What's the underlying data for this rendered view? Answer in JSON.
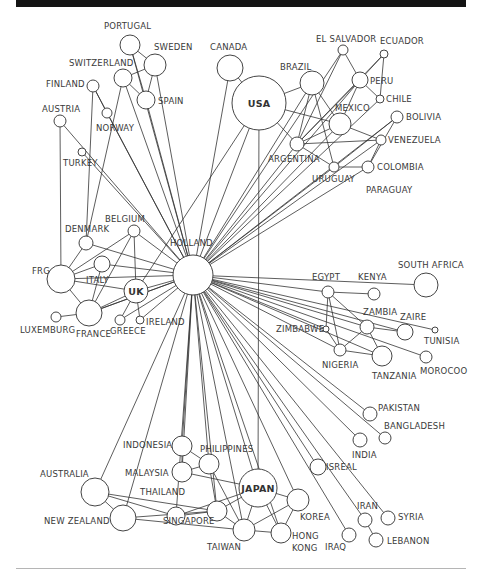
{
  "diagram": {
    "title": "",
    "hub": "HOLLAND",
    "nodes": [
      {
        "id": "HOLLAND",
        "label": "HOLLAND",
        "x": 193,
        "y": 275,
        "r": 20,
        "lx": 170,
        "ly": 246,
        "anchor": "start"
      },
      {
        "id": "USA",
        "label": "USA",
        "x": 259,
        "y": 103,
        "r": 27,
        "inside": true
      },
      {
        "id": "CANADA",
        "label": "CANADA",
        "x": 230,
        "y": 68,
        "r": 13,
        "lx": 210,
        "ly": 50,
        "anchor": "start"
      },
      {
        "id": "BRAZIL",
        "label": "BRAZIL",
        "x": 312,
        "y": 83,
        "r": 12,
        "lx": 280,
        "ly": 70,
        "anchor": "start"
      },
      {
        "id": "EL SALVADOR",
        "label": "EL SALVADOR",
        "x": 343,
        "y": 50,
        "r": 5,
        "lx": 316,
        "ly": 42,
        "anchor": "start"
      },
      {
        "id": "ECUADOR",
        "label": "ECUADOR",
        "x": 384,
        "y": 54,
        "r": 4,
        "lx": 380,
        "ly": 44,
        "anchor": "start"
      },
      {
        "id": "PERU",
        "label": "PERU",
        "x": 360,
        "y": 80,
        "r": 8,
        "lx": 370,
        "ly": 84,
        "anchor": "start"
      },
      {
        "id": "CHILE",
        "label": "CHILE",
        "x": 380,
        "y": 99,
        "r": 4,
        "lx": 386,
        "ly": 102,
        "anchor": "start"
      },
      {
        "id": "MEXICO",
        "label": "MEXICO",
        "x": 340,
        "y": 124,
        "r": 11,
        "lx": 335,
        "ly": 111,
        "anchor": "start"
      },
      {
        "id": "BOLIVIA",
        "label": "BOLIVIA",
        "x": 397,
        "y": 117,
        "r": 6,
        "lx": 406,
        "ly": 120,
        "anchor": "start"
      },
      {
        "id": "VENEZUELA",
        "label": "VENEZUELA",
        "x": 381,
        "y": 140,
        "r": 5,
        "lx": 388,
        "ly": 143,
        "anchor": "start"
      },
      {
        "id": "ARGENTINA",
        "label": "ARGENTINA",
        "x": 297,
        "y": 144,
        "r": 7,
        "lx": 268,
        "ly": 162,
        "anchor": "start"
      },
      {
        "id": "URUGUAY",
        "label": "URUGUAY",
        "x": 334,
        "y": 167,
        "r": 5,
        "lx": 312,
        "ly": 182,
        "anchor": "start"
      },
      {
        "id": "COLOMBIA",
        "label": "COLOMBIA",
        "x": 368,
        "y": 167,
        "r": 6,
        "lx": 377,
        "ly": 170,
        "anchor": "start"
      },
      {
        "id": "PARAGUAY",
        "label": "PARAGUAY",
        "x": 0,
        "y": 0,
        "r": 0,
        "lx": 366,
        "ly": 193,
        "anchor": "start",
        "labelOnly": true
      },
      {
        "id": "PORTUGAL",
        "label": "PORTUGAL",
        "x": 130,
        "y": 45,
        "r": 10,
        "lx": 104,
        "ly": 29,
        "anchor": "start"
      },
      {
        "id": "SWEDEN",
        "label": "SWEDEN",
        "x": 155,
        "y": 65,
        "r": 11,
        "lx": 154,
        "ly": 50,
        "anchor": "start"
      },
      {
        "id": "SWITZERLAND",
        "label": "SWITZERLAND",
        "x": 123,
        "y": 78,
        "r": 9,
        "lx": 69,
        "ly": 66,
        "anchor": "start"
      },
      {
        "id": "SPAIN",
        "label": "SPAIN",
        "x": 146,
        "y": 100,
        "r": 9,
        "lx": 158,
        "ly": 104,
        "anchor": "start"
      },
      {
        "id": "FINLAND",
        "label": "FINLAND",
        "x": 93,
        "y": 86,
        "r": 6,
        "lx": 46,
        "ly": 87,
        "anchor": "start"
      },
      {
        "id": "NORWAY",
        "label": "NORWAY",
        "x": 107,
        "y": 113,
        "r": 5,
        "lx": 96,
        "ly": 131,
        "anchor": "start"
      },
      {
        "id": "AUSTRIA",
        "label": "AUSTRIA",
        "x": 60,
        "y": 121,
        "r": 6,
        "lx": 42,
        "ly": 112,
        "anchor": "start"
      },
      {
        "id": "TURKEY",
        "label": "TURKEY",
        "x": 82,
        "y": 152,
        "r": 4,
        "lx": 63,
        "ly": 166,
        "anchor": "start"
      },
      {
        "id": "BELGIUM",
        "label": "BELGIUM",
        "x": 134,
        "y": 231,
        "r": 6,
        "lx": 105,
        "ly": 222,
        "anchor": "start"
      },
      {
        "id": "DENMARK",
        "label": "DENMARK",
        "x": 86,
        "y": 243,
        "r": 7,
        "lx": 65,
        "ly": 232,
        "anchor": "start"
      },
      {
        "id": "ITALY",
        "label": "ITALY",
        "x": 102,
        "y": 264,
        "r": 8,
        "lx": 86,
        "ly": 283,
        "anchor": "start"
      },
      {
        "id": "FRG",
        "label": "FRG",
        "x": 61,
        "y": 279,
        "r": 14,
        "lx": 32,
        "ly": 274,
        "anchor": "start"
      },
      {
        "id": "UK",
        "label": "UK",
        "x": 136,
        "y": 291,
        "r": 12,
        "inside": true
      },
      {
        "id": "LUXEMBURG",
        "label": "LUXEMBURG",
        "x": 56,
        "y": 317,
        "r": 5,
        "lx": 20,
        "ly": 333,
        "anchor": "start"
      },
      {
        "id": "FRANCE",
        "label": "FRANCE",
        "x": 89,
        "y": 313,
        "r": 13,
        "lx": 76,
        "ly": 337,
        "anchor": "start"
      },
      {
        "id": "GREECE",
        "label": "GREECE",
        "x": 120,
        "y": 320,
        "r": 5,
        "lx": 110,
        "ly": 334,
        "anchor": "start"
      },
      {
        "id": "IRELAND",
        "label": "IRELAND",
        "x": 140,
        "y": 320,
        "r": 4,
        "lx": 146,
        "ly": 325,
        "anchor": "start"
      },
      {
        "id": "EGYPT",
        "label": "EGYPT",
        "x": 328,
        "y": 292,
        "r": 6,
        "lx": 312,
        "ly": 280,
        "anchor": "start"
      },
      {
        "id": "KENYA",
        "label": "KENYA",
        "x": 374,
        "y": 294,
        "r": 6,
        "lx": 358,
        "ly": 280,
        "anchor": "start"
      },
      {
        "id": "SOUTH AFRICA",
        "label": "SOUTH AFRICA",
        "x": 426,
        "y": 285,
        "r": 12,
        "lx": 398,
        "ly": 268,
        "anchor": "start"
      },
      {
        "id": "ZAMBIA",
        "label": "ZAMBIA",
        "x": 367,
        "y": 327,
        "r": 7,
        "lx": 363,
        "ly": 315,
        "anchor": "start"
      },
      {
        "id": "ZAIRE",
        "label": "ZAIRE",
        "x": 405,
        "y": 332,
        "r": 8,
        "lx": 400,
        "ly": 320,
        "anchor": "start"
      },
      {
        "id": "TUNISIA",
        "label": "TUNISIA",
        "x": 435,
        "y": 330,
        "r": 3,
        "lx": 424,
        "ly": 344,
        "anchor": "start"
      },
      {
        "id": "ZIMBABWE",
        "label": "ZIMBABWE",
        "x": 326,
        "y": 329,
        "r": 3,
        "lx": 276,
        "ly": 332,
        "anchor": "start"
      },
      {
        "id": "NIGERIA",
        "label": "NIGERIA",
        "x": 340,
        "y": 350,
        "r": 6,
        "lx": 322,
        "ly": 368,
        "anchor": "start"
      },
      {
        "id": "TANZANIA",
        "label": "TANZANIA",
        "x": 382,
        "y": 356,
        "r": 10,
        "lx": 372,
        "ly": 379,
        "anchor": "start"
      },
      {
        "id": "MOROCOO",
        "label": "MOROCOO",
        "x": 426,
        "y": 357,
        "r": 6,
        "lx": 420,
        "ly": 374,
        "anchor": "start"
      },
      {
        "id": "PAKISTAN",
        "label": "PAKISTAN",
        "x": 370,
        "y": 414,
        "r": 7,
        "lx": 378,
        "ly": 411,
        "anchor": "start"
      },
      {
        "id": "BANGLADESH",
        "label": "BANGLADESH",
        "x": 385,
        "y": 438,
        "r": 6,
        "lx": 384,
        "ly": 429,
        "anchor": "start"
      },
      {
        "id": "INDIA",
        "label": "INDIA",
        "x": 360,
        "y": 440,
        "r": 7,
        "lx": 352,
        "ly": 458,
        "anchor": "start"
      },
      {
        "id": "ISREAL",
        "label": "ISREAL",
        "x": 318,
        "y": 467,
        "r": 8,
        "lx": 326,
        "ly": 470,
        "anchor": "start"
      },
      {
        "id": "IRAN",
        "label": "IRAN",
        "x": 365,
        "y": 520,
        "r": 7,
        "lx": 357,
        "ly": 509,
        "anchor": "start"
      },
      {
        "id": "SYRIA",
        "label": "SYRIA",
        "x": 388,
        "y": 518,
        "r": 7,
        "lx": 398,
        "ly": 520,
        "anchor": "start"
      },
      {
        "id": "LEBANON",
        "label": "LEBANON",
        "x": 376,
        "y": 540,
        "r": 7,
        "lx": 387,
        "ly": 544,
        "anchor": "start"
      },
      {
        "id": "IRAQ",
        "label": "IRAQ",
        "x": 349,
        "y": 535,
        "r": 7,
        "lx": 325,
        "ly": 550,
        "anchor": "start"
      },
      {
        "id": "JAPAN",
        "label": "JAPAN",
        "x": 258,
        "y": 488,
        "r": 19,
        "inside": true
      },
      {
        "id": "KOREA",
        "label": "KOREA",
        "x": 298,
        "y": 500,
        "r": 11,
        "lx": 300,
        "ly": 520,
        "anchor": "start"
      },
      {
        "id": "HONG KONG",
        "label": "HONG",
        "label2": "KONG",
        "x": 281,
        "y": 533,
        "r": 10,
        "lx": 292,
        "ly": 539,
        "anchor": "start"
      },
      {
        "id": "TAIWAN",
        "label": "TAIWAN",
        "x": 244,
        "y": 530,
        "r": 11,
        "lx": 207,
        "ly": 550,
        "anchor": "start"
      },
      {
        "id": "SINGAPORE",
        "label": "SINGAPORE",
        "x": 217,
        "y": 511,
        "r": 10,
        "lx": 163,
        "ly": 524,
        "anchor": "start"
      },
      {
        "id": "THAILAND",
        "label": "THAILAND",
        "x": 176,
        "y": 516,
        "r": 9,
        "lx": 140,
        "ly": 495,
        "anchor": "start"
      },
      {
        "id": "PHILIPPINES",
        "label": "PHILIPPINES",
        "x": 209,
        "y": 464,
        "r": 10,
        "lx": 200,
        "ly": 452,
        "anchor": "start"
      },
      {
        "id": "INDONESIA",
        "label": "INDONESIA",
        "x": 182,
        "y": 446,
        "r": 10,
        "lx": 123,
        "ly": 448,
        "anchor": "start"
      },
      {
        "id": "MALAYSIA",
        "label": "MALAYSIA",
        "x": 182,
        "y": 472,
        "r": 10,
        "lx": 125,
        "ly": 476,
        "anchor": "start"
      },
      {
        "id": "AUSTRALIA",
        "label": "AUSTRALIA",
        "x": 95,
        "y": 492,
        "r": 14,
        "lx": 40,
        "ly": 477,
        "anchor": "start"
      },
      {
        "id": "NEW ZEALAND",
        "label": "NEW ZEALAND",
        "x": 123,
        "y": 518,
        "r": 13,
        "lx": 44,
        "ly": 524,
        "anchor": "start"
      }
    ],
    "edges": [
      [
        "HOLLAND",
        "USA"
      ],
      [
        "HOLLAND",
        "CANADA"
      ],
      [
        "HOLLAND",
        "BRAZIL"
      ],
      [
        "HOLLAND",
        "MEXICO"
      ],
      [
        "HOLLAND",
        "ARGENTINA"
      ],
      [
        "HOLLAND",
        "PERU"
      ],
      [
        "HOLLAND",
        "CHILE"
      ],
      [
        "HOLLAND",
        "VENEZUELA"
      ],
      [
        "HOLLAND",
        "BOLIVIA"
      ],
      [
        "HOLLAND",
        "URUGUAY"
      ],
      [
        "HOLLAND",
        "COLOMBIA"
      ],
      [
        "HOLLAND",
        "EL SALVADOR"
      ],
      [
        "HOLLAND",
        "PORTUGAL"
      ],
      [
        "HOLLAND",
        "SWEDEN"
      ],
      [
        "HOLLAND",
        "SPAIN"
      ],
      [
        "HOLLAND",
        "SWITZERLAND"
      ],
      [
        "HOLLAND",
        "NORWAY"
      ],
      [
        "HOLLAND",
        "AUSTRIA"
      ],
      [
        "HOLLAND",
        "FINLAND"
      ],
      [
        "HOLLAND",
        "TURKEY"
      ],
      [
        "HOLLAND",
        "BELGIUM"
      ],
      [
        "HOLLAND",
        "DENMARK"
      ],
      [
        "HOLLAND",
        "FRG"
      ],
      [
        "HOLLAND",
        "UK"
      ],
      [
        "HOLLAND",
        "ITALY"
      ],
      [
        "HOLLAND",
        "FRANCE"
      ],
      [
        "HOLLAND",
        "GREECE"
      ],
      [
        "HOLLAND",
        "IRELAND"
      ],
      [
        "HOLLAND",
        "EGYPT"
      ],
      [
        "HOLLAND",
        "SOUTH AFRICA"
      ],
      [
        "HOLLAND",
        "ZAMBIA"
      ],
      [
        "HOLLAND",
        "ZAIRE"
      ],
      [
        "HOLLAND",
        "TUNISIA"
      ],
      [
        "HOLLAND",
        "ZIMBABWE"
      ],
      [
        "HOLLAND",
        "NIGERIA"
      ],
      [
        "HOLLAND",
        "TANZANIA"
      ],
      [
        "HOLLAND",
        "MOROCOO"
      ],
      [
        "HOLLAND",
        "PAKISTAN"
      ],
      [
        "HOLLAND",
        "BANGLADESH"
      ],
      [
        "HOLLAND",
        "INDIA"
      ],
      [
        "HOLLAND",
        "ISREAL"
      ],
      [
        "HOLLAND",
        "IRAN"
      ],
      [
        "HOLLAND",
        "IRAQ"
      ],
      [
        "HOLLAND",
        "SYRIA"
      ],
      [
        "HOLLAND",
        "JAPAN"
      ],
      [
        "HOLLAND",
        "KOREA"
      ],
      [
        "HOLLAND",
        "HONG KONG"
      ],
      [
        "HOLLAND",
        "TAIWAN"
      ],
      [
        "HOLLAND",
        "SINGAPORE"
      ],
      [
        "HOLLAND",
        "PHILIPPINES"
      ],
      [
        "HOLLAND",
        "INDONESIA"
      ],
      [
        "HOLLAND",
        "MALAYSIA"
      ],
      [
        "HOLLAND",
        "THAILAND"
      ],
      [
        "HOLLAND",
        "AUSTRALIA"
      ],
      [
        "HOLLAND",
        "NEW ZEALAND"
      ],
      [
        "USA",
        "CANADA"
      ],
      [
        "USA",
        "BRAZIL"
      ],
      [
        "USA",
        "MEXICO"
      ],
      [
        "USA",
        "ARGENTINA"
      ],
      [
        "USA",
        "JAPAN"
      ],
      [
        "USA",
        "UK"
      ],
      [
        "BRAZIL",
        "ARGENTINA"
      ],
      [
        "BRAZIL",
        "MEXICO"
      ],
      [
        "BRAZIL",
        "URUGUAY"
      ],
      [
        "EL SALVADOR",
        "PERU"
      ],
      [
        "EL SALVADOR",
        "ARGENTINA"
      ],
      [
        "ECUADOR",
        "PERU"
      ],
      [
        "ECUADOR",
        "CHILE"
      ],
      [
        "ECUADOR",
        "ARGENTINA"
      ],
      [
        "PERU",
        "CHILE"
      ],
      [
        "PERU",
        "MEXICO"
      ],
      [
        "PERU",
        "ARGENTINA"
      ],
      [
        "MEXICO",
        "ARGENTINA"
      ],
      [
        "MEXICO",
        "VENEZUELA"
      ],
      [
        "ARGENTINA",
        "VENEZUELA"
      ],
      [
        "ARGENTINA",
        "URUGUAY"
      ],
      [
        "URUGUAY",
        "COLOMBIA"
      ],
      [
        "URUGUAY",
        "BOLIVIA"
      ],
      [
        "COLOMBIA",
        "VENEZUELA"
      ],
      [
        "COLOMBIA",
        "BOLIVIA"
      ],
      [
        "PORTUGAL",
        "SWEDEN"
      ],
      [
        "PORTUGAL",
        "SPAIN"
      ],
      [
        "SWEDEN",
        "SWITZERLAND"
      ],
      [
        "SWEDEN",
        "SPAIN"
      ],
      [
        "SWITZERLAND",
        "SPAIN"
      ],
      [
        "FINLAND",
        "NORWAY"
      ],
      [
        "FINLAND",
        "DENMARK"
      ],
      [
        "SWITZERLAND",
        "DENMARK"
      ],
      [
        "AUSTRIA",
        "FRG"
      ],
      [
        "BELGIUM",
        "FRG"
      ],
      [
        "BELGIUM",
        "UK"
      ],
      [
        "BELGIUM",
        "FRANCE"
      ],
      [
        "DENMARK",
        "FRG"
      ],
      [
        "ITALY",
        "FRG"
      ],
      [
        "ITALY",
        "FRANCE"
      ],
      [
        "FRG",
        "UK"
      ],
      [
        "FRG",
        "FRANCE"
      ],
      [
        "UK",
        "FRANCE"
      ],
      [
        "UK",
        "GREECE"
      ],
      [
        "UK",
        "IRELAND"
      ],
      [
        "LUXEMBURG",
        "FRANCE"
      ],
      [
        "FRANCE",
        "HOLLAND"
      ],
      [
        "EGYPT",
        "KENYA"
      ],
      [
        "EGYPT",
        "ZAMBIA"
      ],
      [
        "EGYPT",
        "NIGERIA"
      ],
      [
        "EGYPT",
        "ZIMBABWE"
      ],
      [
        "ZAMBIA",
        "ZAIRE"
      ],
      [
        "ZAMBIA",
        "NIGERIA"
      ],
      [
        "ZAMBIA",
        "TANZANIA"
      ],
      [
        "NIGERIA",
        "TANZANIA"
      ],
      [
        "ZIMBABWE",
        "NIGERIA"
      ],
      [
        "IRAN",
        "LEBANON"
      ],
      [
        "JAPAN",
        "KOREA"
      ],
      [
        "JAPAN",
        "HONG KONG"
      ],
      [
        "JAPAN",
        "TAIWAN"
      ],
      [
        "JAPAN",
        "SINGAPORE"
      ],
      [
        "JAPAN",
        "THAILAND"
      ],
      [
        "JAPAN",
        "MALAYSIA"
      ],
      [
        "KOREA",
        "TAIWAN"
      ],
      [
        "KOREA",
        "HONG KONG"
      ],
      [
        "TAIWAN",
        "HONG KONG"
      ],
      [
        "TAIWAN",
        "SINGAPORE"
      ],
      [
        "SINGAPORE",
        "THAILAND"
      ],
      [
        "SINGAPORE",
        "PHILIPPINES"
      ],
      [
        "INDONESIA",
        "PHILIPPINES"
      ],
      [
        "INDONESIA",
        "MALAYSIA"
      ],
      [
        "MALAYSIA",
        "PHILIPPINES"
      ],
      [
        "PHILIPPINES",
        "TAIWAN"
      ],
      [
        "AUSTRALIA",
        "NEW ZEALAND"
      ],
      [
        "AUSTRALIA",
        "SINGAPORE"
      ],
      [
        "AUSTRALIA",
        "THAILAND"
      ],
      [
        "NEW ZEALAND",
        "SINGAPORE"
      ],
      [
        "NEW ZEALAND",
        "TAIWAN"
      ]
    ]
  }
}
